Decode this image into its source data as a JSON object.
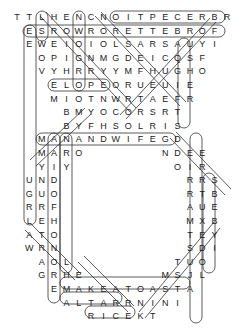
{
  "puzzle": {
    "type": "word-search",
    "shape": "ring",
    "grid_origin": {
      "x": 17,
      "y": 17
    },
    "col_spacing": 12.35,
    "row_spacing": 13.6,
    "rows": [
      {
        "start_col": 0,
        "letters": "TTLHENCNOITPECERBR"
      },
      {
        "start_col": 1,
        "letters": "ESROWRORETTEBROF"
      },
      {
        "start_col": 1,
        "letters": "EWEIOIOLSARSAUYI"
      },
      {
        "start_col": 2,
        "letters": "OPIGNMGDEICQSF"
      },
      {
        "start_col": 2,
        "letters": "VYHRRYYMFHUGHO"
      },
      {
        "start_col": 3,
        "letters": "ELOPEORUEUIE"
      },
      {
        "start_col": 3,
        "letters": "MIOTNWRTAEFR"
      },
      {
        "start_col": 4,
        "letters": "BMYOCORSRT"
      },
      {
        "start_col": 4,
        "letters": "BYFHSOLRIS"
      },
      {
        "start_col": 2,
        "letters": "MANANDWIFEGD"
      },
      {
        "segments": [
          {
            "start_col": 2,
            "letters": "MARO"
          },
          {
            "start_col": 12,
            "letters": "NDEE"
          }
        ]
      },
      {
        "segments": [
          {
            "start_col": 2,
            "letters": "YIY"
          },
          {
            "start_col": 13,
            "letters": "OIR"
          }
        ]
      },
      {
        "segments": [
          {
            "start_col": 1,
            "letters": "UND"
          },
          {
            "start_col": 14,
            "letters": "RRS"
          }
        ]
      },
      {
        "segments": [
          {
            "start_col": 1,
            "letters": "GUO"
          },
          {
            "start_col": 14,
            "letters": "RTB"
          }
        ]
      },
      {
        "segments": [
          {
            "start_col": 1,
            "letters": "RRF"
          },
          {
            "start_col": 14,
            "letters": "AUE"
          }
        ]
      },
      {
        "segments": [
          {
            "start_col": 1,
            "letters": "LEH"
          },
          {
            "start_col": 14,
            "letters": "MXB"
          }
        ]
      },
      {
        "segments": [
          {
            "start_col": 1,
            "letters": "ATO"
          },
          {
            "start_col": 14,
            "letters": "TEY"
          }
        ]
      },
      {
        "segments": [
          {
            "start_col": 1,
            "letters": "WRN"
          },
          {
            "start_col": 14,
            "letters": "SDI"
          }
        ]
      },
      {
        "segments": [
          {
            "start_col": 2,
            "letters": "AOL"
          },
          {
            "start_col": 13,
            "letters": "TUO"
          }
        ]
      },
      {
        "segments": [
          {
            "start_col": 2,
            "letters": "GRHE"
          },
          {
            "start_col": 12,
            "letters": "MSJL"
          }
        ]
      },
      {
        "start_col": 3,
        "letters": "EMAKEATOASTA"
      },
      {
        "start_col": 4,
        "letters": "ALTARRNINI"
      },
      {
        "start_col": 6,
        "letters": "RICEKT"
      }
    ],
    "found_words": [
      "RECEPTION",
      "FORBETTEROR",
      "WORSE",
      "ELOPE",
      "MANANDWIFE",
      "MAKEATOAST",
      "ALTAR",
      "RICE",
      "BRIDE",
      "GROOM",
      "HONEYMOON",
      "TUXEDO",
      "VOWS",
      "RING",
      "GIFTS",
      "DRESS"
    ],
    "colors": {
      "text": "#222222",
      "oval": "#333333",
      "background": "#ffffff"
    }
  }
}
